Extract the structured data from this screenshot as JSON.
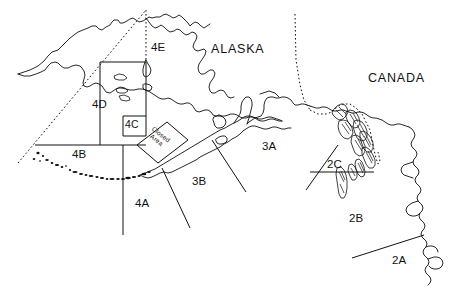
{
  "map": {
    "title": "IPHC Regulatory Areas - Alaska",
    "background_color": "#ffffff",
    "line_color": "#111111",
    "width": 456,
    "height": 290,
    "country_labels": [
      {
        "name": "alaska",
        "text": "ALASKA",
        "x": 211,
        "y": 43
      },
      {
        "name": "canada",
        "text": "CANADA",
        "x": 368,
        "y": 72
      }
    ],
    "area_labels": [
      {
        "name": "4e",
        "text": "4E",
        "x": 151,
        "y": 42
      },
      {
        "name": "4d",
        "text": "4D",
        "x": 92,
        "y": 99
      },
      {
        "name": "4c",
        "text": "4C",
        "x": 125,
        "y": 119
      },
      {
        "name": "4b",
        "text": "4B",
        "x": 72,
        "y": 149
      },
      {
        "name": "4a",
        "text": "4A",
        "x": 135,
        "y": 198
      },
      {
        "name": "3b",
        "text": "3B",
        "x": 192,
        "y": 176
      },
      {
        "name": "3a",
        "text": "3A",
        "x": 262,
        "y": 141
      },
      {
        "name": "2c",
        "text": "2C",
        "x": 327,
        "y": 159
      },
      {
        "name": "2b",
        "text": "2B",
        "x": 349,
        "y": 213
      },
      {
        "name": "2a",
        "text": "2A",
        "x": 392,
        "y": 255
      }
    ],
    "closed_area": {
      "name": "closed-area",
      "line1": "Closed",
      "line2": "Area",
      "x": 148,
      "y": 130,
      "rotation_deg": 38
    }
  }
}
